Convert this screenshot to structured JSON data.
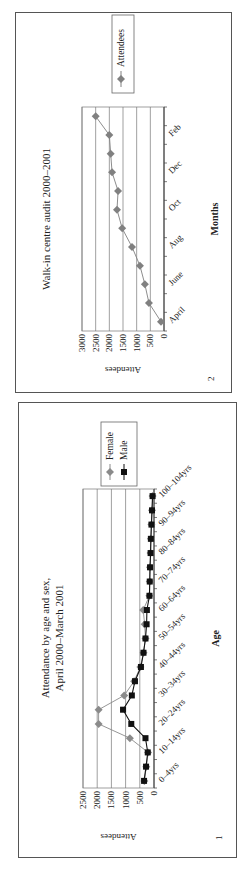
{
  "page": {
    "orientation": "rotated-90-ccw"
  },
  "figures": [
    {
      "number": "2",
      "title": "Walk-in centre audit 2000–2001",
      "xlabel": "Months",
      "ylabel": "Attendees",
      "legend": [
        "Attendees"
      ]
    },
    {
      "number": "1",
      "title_line1": "Attendance by age and sex,",
      "title_line2": "April 2000–March 2001",
      "xlabel": "Age",
      "ylabel": "Attendees",
      "legend": [
        "Female",
        "Male"
      ]
    }
  ],
  "chart_data": [
    {
      "id": "figure-2",
      "type": "line",
      "title": "Walk-in centre audit 2000–2001",
      "xlabel": "Months",
      "ylabel": "Attendees",
      "ylim": [
        0,
        3000
      ],
      "yticks": [
        0,
        500,
        1000,
        1500,
        2000,
        2500,
        3000
      ],
      "grid": true,
      "legend_position": "right",
      "categories": [
        "April",
        "May",
        "June",
        "July",
        "Aug",
        "Sep",
        "Oct",
        "Nov",
        "Dec",
        "Jan",
        "Feb",
        "Mar"
      ],
      "tick_labels_shown": [
        "April",
        "June",
        "Aug",
        "Oct",
        "Dec",
        "Feb"
      ],
      "series": [
        {
          "name": "Attendees",
          "color": "#808080",
          "marker": "diamond",
          "values": [
            110,
            550,
            700,
            880,
            1170,
            1530,
            1720,
            1680,
            1900,
            1950,
            2000,
            2500
          ]
        }
      ]
    },
    {
      "id": "figure-1",
      "type": "line",
      "title": "Attendance by age and sex, April 2000–March 2001",
      "xlabel": "Age",
      "ylabel": "Attendees",
      "ylim": [
        0,
        2500
      ],
      "yticks": [
        0,
        500,
        1000,
        1500,
        2000,
        2500
      ],
      "grid": true,
      "legend_position": "right",
      "categories": [
        "0–4yrs",
        "5–9yrs",
        "10–14yrs",
        "15–19yrs",
        "20–24yrs",
        "25–29yrs",
        "30–34yrs",
        "35–39yrs",
        "40–44yrs",
        "45–49yrs",
        "50–54yrs",
        "55–59yrs",
        "60–64yrs",
        "65–69yrs",
        "70–74yrs",
        "75–79yrs",
        "80–84yrs",
        "85–89yrs",
        "90–94yrs",
        "95–99yrs",
        "100–104yrs"
      ],
      "tick_labels_shown": [
        "0–4yrs",
        "10–14yrs",
        "20–24yrs",
        "30–34yrs",
        "40–44yrs",
        "50–54yrs",
        "60–64yrs",
        "70–74yrs",
        "80–84yrs",
        "90–94yrs",
        "100–104yrs"
      ],
      "series": [
        {
          "name": "Female",
          "color": "#8a8a8a",
          "marker": "diamond",
          "values": [
            340,
            270,
            210,
            850,
            1950,
            1950,
            1050,
            700,
            480,
            370,
            300,
            330,
            380,
            160,
            150,
            140,
            120,
            110,
            90,
            70,
            50
          ]
        },
        {
          "name": "Male",
          "color": "#111111",
          "marker": "square",
          "values": [
            350,
            280,
            220,
            300,
            800,
            1090,
            780,
            670,
            460,
            370,
            300,
            260,
            250,
            160,
            150,
            140,
            120,
            110,
            90,
            70,
            50
          ]
        }
      ]
    }
  ]
}
